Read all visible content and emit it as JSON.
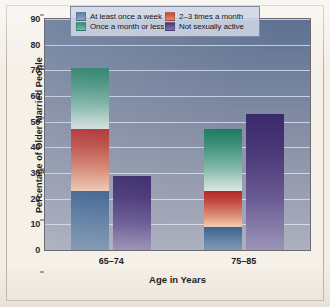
{
  "chart_data": {
    "type": "bar",
    "subtype": "stacked-and-grouped",
    "title": "",
    "xlabel": "Age in Years",
    "ylabel": "Percentage of Older Married People",
    "categories": [
      "65–74",
      "75–85"
    ],
    "ylim": [
      0,
      90
    ],
    "yticks": [
      0,
      10,
      20,
      30,
      40,
      50,
      60,
      70,
      80,
      90
    ],
    "ytick_labels": [
      "0",
      "10",
      "20",
      "30",
      "40",
      "50",
      "60",
      "70",
      "80",
      "90"
    ],
    "grid": true,
    "legend_position": "top-center-inside",
    "series": [
      {
        "name": "At least once a week",
        "color": "#5d83ac",
        "stack": "frequency",
        "values": [
          23,
          9
        ]
      },
      {
        "name": "2–3 times a month",
        "color": "#cf4a33",
        "stack": "frequency",
        "values": [
          24,
          14
        ]
      },
      {
        "name": "Once a month or less",
        "color": "#2f9479",
        "stack": "frequency",
        "values": [
          24,
          24
        ]
      },
      {
        "name": "Not sexually active",
        "color": "#4b3a7e",
        "stack": "inactive",
        "values": [
          29,
          53
        ]
      }
    ],
    "stack_totals": {
      "frequency": [
        71,
        47
      ],
      "inactive": [
        29,
        53
      ]
    }
  },
  "legend": {
    "items": [
      {
        "label": "At least once a week",
        "swatch": "sw-week"
      },
      {
        "label": "2–3 times a month",
        "swatch": "sw-twothree"
      },
      {
        "label": "Once a month or less",
        "swatch": "sw-month"
      },
      {
        "label": "Not sexually active",
        "swatch": "sw-notactive"
      }
    ]
  },
  "colors": {
    "plot_background_top": "#5d7192",
    "plot_background_bottom": "#adb1bf",
    "figure_background": "#f4eee6",
    "gridline": "#e8eef6"
  }
}
